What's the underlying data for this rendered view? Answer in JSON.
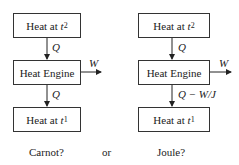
{
  "left": {
    "top_box": {
      "text": "Heat at ",
      "var": "t",
      "sub": "2"
    },
    "engine_box": "Heat Engine",
    "bottom_box": {
      "text": "Heat at ",
      "var": "t",
      "sub": "1"
    },
    "arrow_in_label": "Q",
    "arrow_out_label": "Q",
    "work_label": "W",
    "caption": "Carnot?"
  },
  "middle_caption": "or",
  "right": {
    "top_box": {
      "text": "Heat at ",
      "var": "t",
      "sub": "2"
    },
    "engine_box": "Heat Engine",
    "bottom_box": {
      "text": "Heat at ",
      "var": "t",
      "sub": "1"
    },
    "arrow_in_label": "Q",
    "arrow_out_label": "Q − W/J",
    "work_label": "W",
    "caption": "Joule?"
  }
}
